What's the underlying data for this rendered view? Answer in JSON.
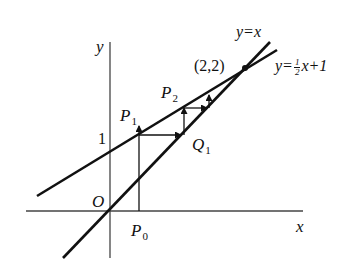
{
  "figure": {
    "axes": {
      "x_label": "x",
      "y_label": "y",
      "origin_label": "O",
      "y_tick_label": "1"
    },
    "lines": [
      {
        "name": "identity",
        "label": "y=x"
      },
      {
        "name": "half-plus-one",
        "label_prefix": "y=",
        "label_frac_num": "1",
        "label_frac_den": "2",
        "label_suffix": "x+1"
      }
    ],
    "intersection": {
      "label": "(2,2)"
    },
    "points": {
      "P0": {
        "letter": "P",
        "index": "0"
      },
      "P1": {
        "letter": "P",
        "index": "1"
      },
      "P2": {
        "letter": "P",
        "index": "2"
      },
      "Q1": {
        "letter": "Q",
        "index": "1"
      }
    }
  }
}
